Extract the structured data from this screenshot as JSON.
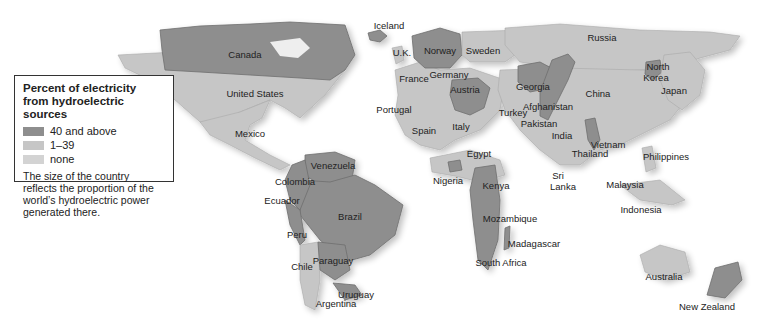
{
  "legend": {
    "title_line1": "Percent of electricity",
    "title_line2": "from hydroelectric sources",
    "categories": [
      {
        "label": "40 and above",
        "color": "#8e8e8e"
      },
      {
        "label": "1–39",
        "color": "#c6c6c6"
      },
      {
        "label": "none",
        "color": "#d3d3d3"
      }
    ],
    "note": "The size of the country reflects the proportion of the world’s hydroelectric power generated there."
  },
  "countries": {
    "canada": {
      "name": "Canada",
      "category": "40 and above"
    },
    "united_states": {
      "name": "United States",
      "category": "1–39"
    },
    "mexico": {
      "name": "Mexico",
      "category": "1–39"
    },
    "iceland": {
      "name": "Iceland",
      "category": "40 and above"
    },
    "uk": {
      "name": "U.K.",
      "category": "1–39"
    },
    "norway": {
      "name": "Norway",
      "category": "40 and above"
    },
    "sweden": {
      "name": "Sweden",
      "category": "1–39"
    },
    "france": {
      "name": "France",
      "category": "1–39"
    },
    "germany": {
      "name": "Germany",
      "category": "1–39"
    },
    "austria": {
      "name": "Austria",
      "category": "40 and above"
    },
    "portugal": {
      "name": "Portugal",
      "category": "1–39"
    },
    "spain": {
      "name": "Spain",
      "category": "1–39"
    },
    "italy": {
      "name": "Italy",
      "category": "1–39"
    },
    "russia": {
      "name": "Russia",
      "category": "1–39"
    },
    "georgia": {
      "name": "Georgia",
      "category": "40 and above"
    },
    "turkey": {
      "name": "Turkey",
      "category": "1–39"
    },
    "afghanistan": {
      "name": "Afghanistan",
      "category": "40 and above"
    },
    "pakistan": {
      "name": "Pakistan",
      "category": "1–39"
    },
    "india": {
      "name": "India",
      "category": "1–39"
    },
    "china": {
      "name": "China",
      "category": "1–39"
    },
    "north_korea": {
      "name": "North Korea",
      "category": "40 and above"
    },
    "japan": {
      "name": "Japan",
      "category": "1–39"
    },
    "vietnam": {
      "name": "Vietnam",
      "category": "1–39"
    },
    "thailand": {
      "name": "Thailand",
      "category": "1–39"
    },
    "philippines": {
      "name": "Philippines",
      "category": "1–39"
    },
    "malaysia": {
      "name": "Malaysia",
      "category": "1–39"
    },
    "indonesia": {
      "name": "Indonesia",
      "category": "1–39"
    },
    "sri_lanka": {
      "name": "Sri Lanka",
      "category": "1–39"
    },
    "egypt": {
      "name": "Egypt",
      "category": "1–39"
    },
    "nigeria": {
      "name": "Nigeria",
      "category": "1–39"
    },
    "kenya": {
      "name": "Kenya",
      "category": "40 and above"
    },
    "mozambique": {
      "name": "Mozambique",
      "category": "40 and above"
    },
    "madagascar": {
      "name": "Madagascar",
      "category": "40 and above"
    },
    "south_africa": {
      "name": "South Africa",
      "category": "1–39"
    },
    "venezuela": {
      "name": "Venezuela",
      "category": "40 and above"
    },
    "colombia": {
      "name": "Colombia",
      "category": "40 and above"
    },
    "ecuador": {
      "name": "Ecuador",
      "category": "40 and above"
    },
    "brazil": {
      "name": "Brazil",
      "category": "40 and above"
    },
    "peru": {
      "name": "Peru",
      "category": "40 and above"
    },
    "chile": {
      "name": "Chile",
      "category": "1–39"
    },
    "paraguay": {
      "name": "Paraguay",
      "category": "40 and above"
    },
    "uruguay": {
      "name": "Uruguay",
      "category": "40 and above"
    },
    "argentina": {
      "name": "Argentina",
      "category": "1–39"
    },
    "australia": {
      "name": "Australia",
      "category": "1–39"
    },
    "new_zealand": {
      "name": "New Zealand",
      "category": "40 and above"
    }
  }
}
